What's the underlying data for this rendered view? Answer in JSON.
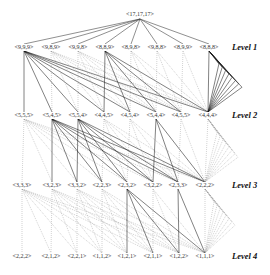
{
  "diagram": {
    "root": {
      "label": "<17,17,17>",
      "x": 140,
      "y": 14
    },
    "levels": [
      {
        "name": "Level 1",
        "y": 47,
        "nodes": [
          {
            "label": "<9,9,9>",
            "x": 24
          },
          {
            "label": "<9,8,9>",
            "x": 51
          },
          {
            "label": "<9,9,8>",
            "x": 78
          },
          {
            "label": "<8,8,9>",
            "x": 105
          },
          {
            "label": "<8,9,8>",
            "x": 131
          },
          {
            "label": "<9,8,8>",
            "x": 157
          },
          {
            "label": "<8,9,9>",
            "x": 183
          },
          {
            "label": "<8,8,8>",
            "x": 209
          }
        ]
      },
      {
        "name": "Level 2",
        "y": 115,
        "nodes": [
          {
            "label": "<5,5,5>",
            "x": 24
          },
          {
            "label": "<5,4,5>",
            "x": 52
          },
          {
            "label": "<5,5,4>",
            "x": 78
          },
          {
            "label": "<4,4,5>",
            "x": 104
          },
          {
            "label": "<4,5,4>",
            "x": 130
          },
          {
            "label": "<5,4,4>",
            "x": 156
          },
          {
            "label": "<4,5,5>",
            "x": 181
          },
          {
            "label": "<4,4,4>",
            "x": 208
          }
        ]
      },
      {
        "name": "Level 3",
        "y": 185,
        "nodes": [
          {
            "label": "<3,3,3>",
            "x": 22
          },
          {
            "label": "<3,2,3>",
            "x": 52
          },
          {
            "label": "<3,3,2>",
            "x": 77
          },
          {
            "label": "<2,2,3>",
            "x": 102
          },
          {
            "label": "<2,3,2>",
            "x": 127
          },
          {
            "label": "<3,2,2>",
            "x": 153
          },
          {
            "label": "<2,3,3>",
            "x": 178
          },
          {
            "label": "<2,2,2>",
            "x": 205
          }
        ]
      },
      {
        "name": "Level 4",
        "y": 256,
        "nodes": [
          {
            "label": "<2,2,2>",
            "x": 22
          },
          {
            "label": "<2,1,2>",
            "x": 51
          },
          {
            "label": "<2,2,1>",
            "x": 77
          },
          {
            "label": "<1,1,2>",
            "x": 102
          },
          {
            "label": "<1,2,1>",
            "x": 127
          },
          {
            "label": "<2,1,1>",
            "x": 153
          },
          {
            "label": "<1,2,2>",
            "x": 179
          },
          {
            "label": "<1,1,1>",
            "x": 205
          }
        ]
      }
    ],
    "level_label_x": 232,
    "solid_sources": [
      [
        0,
        3,
        7
      ],
      [
        1,
        2,
        5
      ],
      [
        4,
        6
      ]
    ],
    "fan_points": [
      {
        "x": 242,
        "y": 88
      },
      {
        "x": 238,
        "y": 158
      },
      {
        "x": 235,
        "y": 226
      }
    ],
    "colors": {
      "solid_edge": "#1a1a1a",
      "dotted_edge": "#9a9a9a",
      "root_edge": "#444444"
    }
  }
}
